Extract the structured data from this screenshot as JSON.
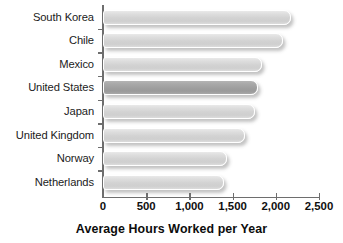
{
  "chart_data": {
    "type": "bar",
    "orientation": "horizontal",
    "title": "",
    "xlabel": "Average Hours Worked per Year",
    "ylabel": "",
    "categories": [
      "South Korea",
      "Chile",
      "Mexico",
      "United States",
      "Japan",
      "United Kingdom",
      "Norway",
      "Netherlands"
    ],
    "values": [
      2180,
      2080,
      1840,
      1790,
      1760,
      1645,
      1430,
      1400
    ],
    "xlim": [
      0,
      2500
    ],
    "xticks": [
      0,
      500,
      1000,
      1500,
      2000,
      2500
    ],
    "xticklabels": [
      "0",
      "500",
      "1,000",
      "1,500",
      "2,000",
      "2,500"
    ],
    "grid": false,
    "legend": false,
    "highlight_category": "United States",
    "colors": {
      "bar": "#d2d2d2",
      "bar_highlight": "#9e9e9e",
      "bar_outline": "#ffffff",
      "axis": "#6e6e6e",
      "text": "#101010",
      "background": "#ffffff"
    }
  }
}
